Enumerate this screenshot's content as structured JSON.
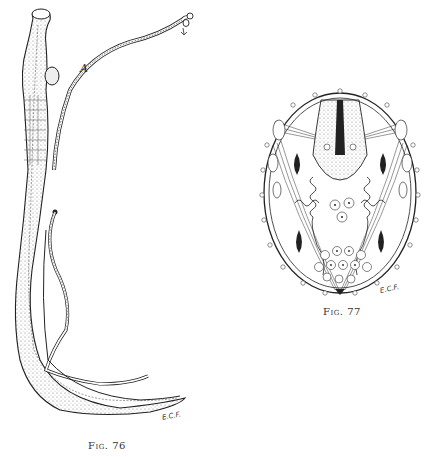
{
  "figures": [
    {
      "id": "fig76",
      "caption": "Fig. 76",
      "label": "A",
      "signature": "E.C.F.",
      "subject": "nematode-worm-pair-illustration"
    },
    {
      "id": "fig77",
      "caption": "Fig. 77",
      "signature": "E.C.F.",
      "subject": "cross-section-oval-illustration"
    }
  ]
}
